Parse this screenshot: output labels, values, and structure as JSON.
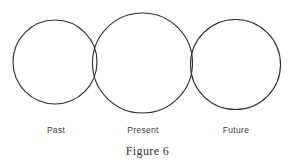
{
  "figure": {
    "caption": "Figure 6",
    "background_color": "#ffffff",
    "stroke_color": "#2b2b2b",
    "label_color": "#3a3a3a"
  },
  "chart_data": {
    "type": "diagram",
    "title": "Figure 6",
    "shape": "circle",
    "labels": [
      "Past",
      "Present",
      "Future"
    ],
    "circles": [
      {
        "label": "Past",
        "cx": 55,
        "cy": 62,
        "r": 42
      },
      {
        "label": "Present",
        "cx": 142.5,
        "cy": 63,
        "r": 50
      },
      {
        "label": "Future",
        "cx": 235.5,
        "cy": 64.5,
        "r": 45
      }
    ],
    "xlabel": "",
    "ylabel": "",
    "legend": "none",
    "grid": false
  },
  "labels": {
    "past": "Past",
    "present": "Present",
    "future": "Future"
  }
}
